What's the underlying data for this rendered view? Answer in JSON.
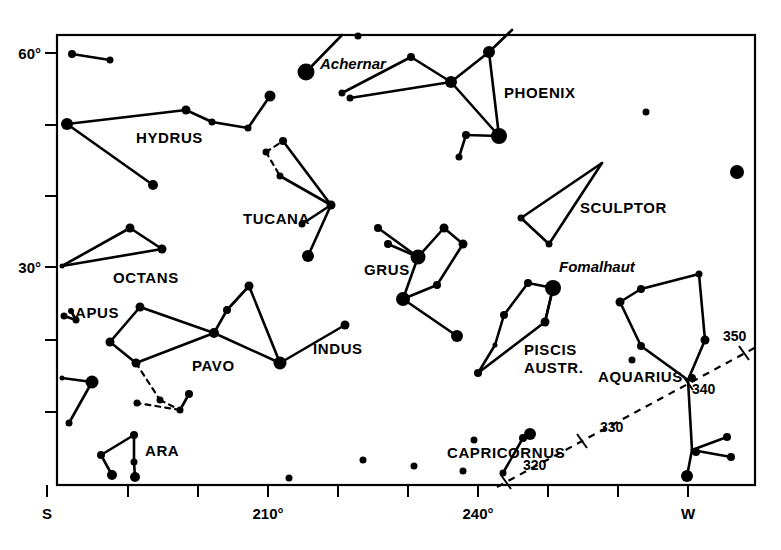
{
  "chart_data": {
    "type": "scatter",
    "title": "",
    "subtitle": "",
    "xlabel": "",
    "ylabel": "",
    "grid": false,
    "legend": null,
    "plot_frame": {
      "x0": 57,
      "y0": 35,
      "x1": 755,
      "y1": 485
    },
    "x_axis": {
      "range_label": [
        "S",
        "W"
      ],
      "ticks": [
        {
          "px": 47,
          "label": "S",
          "show_label": true
        },
        {
          "px": 128,
          "label": "",
          "show_label": false
        },
        {
          "px": 198,
          "label": "",
          "show_label": false
        },
        {
          "px": 268,
          "label": "210°",
          "show_label": true
        },
        {
          "px": 338,
          "label": "",
          "show_label": false
        },
        {
          "px": 408,
          "label": "",
          "show_label": false
        },
        {
          "px": 478,
          "label": "240°",
          "show_label": true
        },
        {
          "px": 548,
          "label": "",
          "show_label": false
        },
        {
          "px": 618,
          "label": "",
          "show_label": false
        },
        {
          "px": 688,
          "label": "W",
          "show_label": true
        }
      ]
    },
    "y_axis": {
      "ticks": [
        {
          "px": 53,
          "label": "60°",
          "show_label": true
        },
        {
          "px": 125,
          "label": "",
          "show_label": false
        },
        {
          "px": 196,
          "label": "",
          "show_label": false
        },
        {
          "px": 267,
          "label": "30°",
          "show_label": true
        },
        {
          "px": 340,
          "label": "",
          "show_label": false
        },
        {
          "px": 412,
          "label": "",
          "show_label": false
        }
      ]
    },
    "ecliptic": {
      "style": "dashed",
      "path": [
        [
          497,
          487
        ],
        [
          760,
          345
        ]
      ],
      "ticks": [
        {
          "x": 506,
          "y": 482,
          "label": "320",
          "lx": 523,
          "ly": 470
        },
        {
          "x": 582,
          "y": 441,
          "label": "330",
          "lx": 600,
          "ly": 432
        },
        {
          "x": 688,
          "y": 383,
          "label": "340",
          "lx": 692,
          "ly": 394
        },
        {
          "x": 744,
          "y": 353,
          "label": "350",
          "lx": 723,
          "ly": 341
        }
      ]
    },
    "constellation_labels": [
      {
        "name": "HYDRUS",
        "x": 136,
        "y": 143
      },
      {
        "name": "OCTANS",
        "x": 113,
        "y": 283
      },
      {
        "name": "APUS",
        "x": 75,
        "y": 318
      },
      {
        "name": "PAVO",
        "x": 192,
        "y": 371
      },
      {
        "name": "ARA",
        "x": 145,
        "y": 456
      },
      {
        "name": "TUCANA",
        "x": 243,
        "y": 224
      },
      {
        "name": "INDUS",
        "x": 313,
        "y": 354
      },
      {
        "name": "GRUS",
        "x": 364,
        "y": 275
      },
      {
        "name": "PHOENIX",
        "x": 504,
        "y": 98
      },
      {
        "name": "SCULPTOR",
        "x": 580,
        "y": 213
      },
      {
        "name": "PISCIS",
        "x": 524,
        "y": 355
      },
      {
        "name": "AUSTR.",
        "x": 524,
        "y": 373
      },
      {
        "name": "AQUARIUS",
        "x": 598,
        "y": 382
      },
      {
        "name": "CAPRICORNUS",
        "x": 447,
        "y": 458
      }
    ],
    "star_labels": [
      {
        "name": "Achernar",
        "x": 320,
        "y": 69
      },
      {
        "name": "Fomalhaut",
        "x": 559,
        "y": 272
      }
    ],
    "stars": [
      {
        "x": 72,
        "y": 54,
        "r": 4.0
      },
      {
        "x": 110,
        "y": 60,
        "r": 3.5
      },
      {
        "x": 67,
        "y": 124,
        "r": 6.0
      },
      {
        "x": 186,
        "y": 110,
        "r": 4.5
      },
      {
        "x": 212,
        "y": 122,
        "r": 3.5
      },
      {
        "x": 248,
        "y": 128,
        "r": 3.5
      },
      {
        "x": 270,
        "y": 96,
        "r": 5.5
      },
      {
        "x": 153,
        "y": 185,
        "r": 5.0
      },
      {
        "x": 130,
        "y": 228,
        "r": 4.5
      },
      {
        "x": 162,
        "y": 249,
        "r": 4.5
      },
      {
        "x": 62,
        "y": 266,
        "r": 2.5
      },
      {
        "x": 64,
        "y": 316,
        "r": 3.5
      },
      {
        "x": 76,
        "y": 320,
        "r": 3.5
      },
      {
        "x": 71,
        "y": 311,
        "r": 3.0
      },
      {
        "x": 92,
        "y": 382,
        "r": 6.5
      },
      {
        "x": 62,
        "y": 378,
        "r": 2.5
      },
      {
        "x": 69,
        "y": 423,
        "r": 3.5
      },
      {
        "x": 140,
        "y": 307,
        "r": 4.5
      },
      {
        "x": 110,
        "y": 342,
        "r": 4.5
      },
      {
        "x": 136,
        "y": 363,
        "r": 4.5
      },
      {
        "x": 214,
        "y": 333,
        "r": 5.0
      },
      {
        "x": 227,
        "y": 310,
        "r": 4.0
      },
      {
        "x": 249,
        "y": 286,
        "r": 4.5
      },
      {
        "x": 280,
        "y": 363,
        "r": 6.5
      },
      {
        "x": 160,
        "y": 400,
        "r": 3.5
      },
      {
        "x": 137,
        "y": 403,
        "r": 3.5
      },
      {
        "x": 180,
        "y": 410,
        "r": 3.5
      },
      {
        "x": 189,
        "y": 394,
        "r": 4.0
      },
      {
        "x": 134,
        "y": 435,
        "r": 4.0
      },
      {
        "x": 101,
        "y": 455,
        "r": 4.0
      },
      {
        "x": 112,
        "y": 475,
        "r": 5.0
      },
      {
        "x": 135,
        "y": 477,
        "r": 5.0
      },
      {
        "x": 134,
        "y": 462,
        "r": 3.5
      },
      {
        "x": 280,
        "y": 176,
        "r": 3.5
      },
      {
        "x": 266,
        "y": 152,
        "r": 3.5
      },
      {
        "x": 283,
        "y": 141,
        "r": 4.0
      },
      {
        "x": 331,
        "y": 205,
        "r": 4.5
      },
      {
        "x": 308,
        "y": 256,
        "r": 6.0
      },
      {
        "x": 302,
        "y": 224,
        "r": 3.5
      },
      {
        "x": 345,
        "y": 325,
        "r": 4.5
      },
      {
        "x": 306,
        "y": 72,
        "r": 8.5
      },
      {
        "x": 358,
        "y": 36,
        "r": 3.5
      },
      {
        "x": 342,
        "y": 93,
        "r": 3.5
      },
      {
        "x": 411,
        "y": 57,
        "r": 4.0
      },
      {
        "x": 350,
        "y": 98,
        "r": 3.5
      },
      {
        "x": 451,
        "y": 82,
        "r": 6.0
      },
      {
        "x": 489,
        "y": 52,
        "r": 6.0
      },
      {
        "x": 499,
        "y": 136,
        "r": 8.0
      },
      {
        "x": 466,
        "y": 135,
        "r": 4.0
      },
      {
        "x": 459,
        "y": 157,
        "r": 3.5
      },
      {
        "x": 378,
        "y": 228,
        "r": 4.0
      },
      {
        "x": 388,
        "y": 244,
        "r": 4.0
      },
      {
        "x": 418,
        "y": 257,
        "r": 7.5
      },
      {
        "x": 444,
        "y": 228,
        "r": 4.5
      },
      {
        "x": 463,
        "y": 244,
        "r": 4.5
      },
      {
        "x": 437,
        "y": 285,
        "r": 4.0
      },
      {
        "x": 403,
        "y": 299,
        "r": 7.0
      },
      {
        "x": 457,
        "y": 336,
        "r": 6.0
      },
      {
        "x": 528,
        "y": 283,
        "r": 4.0
      },
      {
        "x": 553,
        "y": 288,
        "r": 8.0
      },
      {
        "x": 504,
        "y": 315,
        "r": 4.0
      },
      {
        "x": 545,
        "y": 322,
        "r": 4.5
      },
      {
        "x": 495,
        "y": 345,
        "r": 2.5
      },
      {
        "x": 478,
        "y": 373,
        "r": 4.0
      },
      {
        "x": 521,
        "y": 218,
        "r": 3.5
      },
      {
        "x": 549,
        "y": 244,
        "r": 3.5
      },
      {
        "x": 646,
        "y": 112,
        "r": 3.5
      },
      {
        "x": 737,
        "y": 172,
        "r": 7.0
      },
      {
        "x": 641,
        "y": 289,
        "r": 4.0
      },
      {
        "x": 620,
        "y": 302,
        "r": 4.5
      },
      {
        "x": 699,
        "y": 274,
        "r": 3.5
      },
      {
        "x": 641,
        "y": 346,
        "r": 4.0
      },
      {
        "x": 632,
        "y": 360,
        "r": 3.5
      },
      {
        "x": 705,
        "y": 340,
        "r": 4.5
      },
      {
        "x": 692,
        "y": 378,
        "r": 4.0
      },
      {
        "x": 696,
        "y": 452,
        "r": 4.0
      },
      {
        "x": 727,
        "y": 437,
        "r": 4.0
      },
      {
        "x": 731,
        "y": 457,
        "r": 4.0
      },
      {
        "x": 687,
        "y": 476,
        "r": 6.0
      },
      {
        "x": 523,
        "y": 438,
        "r": 4.0
      },
      {
        "x": 530,
        "y": 434,
        "r": 6.0
      },
      {
        "x": 474,
        "y": 440,
        "r": 3.5
      },
      {
        "x": 463,
        "y": 471,
        "r": 3.5
      },
      {
        "x": 503,
        "y": 473,
        "r": 3.5
      },
      {
        "x": 414,
        "y": 466,
        "r": 3.5
      },
      {
        "x": 363,
        "y": 460,
        "r": 3.5
      },
      {
        "x": 289,
        "y": 478,
        "r": 3.5
      }
    ],
    "lines_solid": [
      [
        [
          72,
          54
        ],
        [
          110,
          60
        ]
      ],
      [
        [
          67,
          124
        ],
        [
          186,
          110
        ]
      ],
      [
        [
          186,
          110
        ],
        [
          212,
          122
        ]
      ],
      [
        [
          212,
          122
        ],
        [
          248,
          128
        ]
      ],
      [
        [
          248,
          128
        ],
        [
          270,
          96
        ]
      ],
      [
        [
          67,
          124
        ],
        [
          153,
          185
        ]
      ],
      [
        [
          62,
          266
        ],
        [
          130,
          228
        ]
      ],
      [
        [
          130,
          228
        ],
        [
          162,
          249
        ]
      ],
      [
        [
          162,
          249
        ],
        [
          62,
          266
        ]
      ],
      [
        [
          64,
          316
        ],
        [
          76,
          320
        ]
      ],
      [
        [
          71,
          311
        ],
        [
          76,
          320
        ]
      ],
      [
        [
          62,
          378
        ],
        [
          92,
          382
        ]
      ],
      [
        [
          92,
          382
        ],
        [
          69,
          423
        ]
      ],
      [
        [
          140,
          307
        ],
        [
          110,
          342
        ]
      ],
      [
        [
          110,
          342
        ],
        [
          136,
          363
        ]
      ],
      [
        [
          136,
          363
        ],
        [
          214,
          333
        ]
      ],
      [
        [
          214,
          333
        ],
        [
          140,
          307
        ]
      ],
      [
        [
          214,
          333
        ],
        [
          227,
          310
        ]
      ],
      [
        [
          227,
          310
        ],
        [
          249,
          286
        ]
      ],
      [
        [
          249,
          286
        ],
        [
          280,
          363
        ]
      ],
      [
        [
          214,
          333
        ],
        [
          280,
          363
        ]
      ],
      [
        [
          189,
          394
        ],
        [
          180,
          410
        ]
      ],
      [
        [
          134,
          435
        ],
        [
          101,
          455
        ]
      ],
      [
        [
          101,
          455
        ],
        [
          112,
          475
        ]
      ],
      [
        [
          134,
          435
        ],
        [
          134,
          462
        ]
      ],
      [
        [
          134,
          462
        ],
        [
          135,
          477
        ]
      ],
      [
        [
          283,
          141
        ],
        [
          331,
          205
        ]
      ],
      [
        [
          280,
          176
        ],
        [
          331,
          205
        ]
      ],
      [
        [
          331,
          205
        ],
        [
          308,
          256
        ]
      ],
      [
        [
          302,
          224
        ],
        [
          331,
          205
        ]
      ],
      [
        [
          345,
          325
        ],
        [
          280,
          363
        ]
      ],
      [
        [
          306,
          72
        ],
        [
          342,
          35
        ]
      ],
      [
        [
          342,
          93
        ],
        [
          411,
          57
        ]
      ],
      [
        [
          411,
          57
        ],
        [
          451,
          82
        ]
      ],
      [
        [
          350,
          98
        ],
        [
          451,
          82
        ]
      ],
      [
        [
          451,
          82
        ],
        [
          489,
          52
        ]
      ],
      [
        [
          489,
          52
        ],
        [
          512,
          30
        ]
      ],
      [
        [
          451,
          82
        ],
        [
          499,
          136
        ]
      ],
      [
        [
          489,
          52
        ],
        [
          499,
          136
        ]
      ],
      [
        [
          466,
          135
        ],
        [
          499,
          136
        ]
      ],
      [
        [
          459,
          157
        ],
        [
          466,
          135
        ]
      ],
      [
        [
          378,
          228
        ],
        [
          418,
          257
        ]
      ],
      [
        [
          388,
          244
        ],
        [
          418,
          257
        ]
      ],
      [
        [
          418,
          257
        ],
        [
          444,
          228
        ]
      ],
      [
        [
          444,
          228
        ],
        [
          463,
          244
        ]
      ],
      [
        [
          463,
          244
        ],
        [
          437,
          285
        ]
      ],
      [
        [
          437,
          285
        ],
        [
          403,
          299
        ]
      ],
      [
        [
          418,
          257
        ],
        [
          403,
          299
        ]
      ],
      [
        [
          403,
          299
        ],
        [
          457,
          336
        ]
      ],
      [
        [
          521,
          218
        ],
        [
          602,
          163
        ]
      ],
      [
        [
          549,
          244
        ],
        [
          602,
          163
        ]
      ],
      [
        [
          521,
          218
        ],
        [
          549,
          244
        ]
      ],
      [
        [
          528,
          283
        ],
        [
          553,
          288
        ]
      ],
      [
        [
          528,
          283
        ],
        [
          504,
          315
        ]
      ],
      [
        [
          504,
          315
        ],
        [
          495,
          345
        ]
      ],
      [
        [
          495,
          345
        ],
        [
          478,
          373
        ]
      ],
      [
        [
          478,
          373
        ],
        [
          545,
          322
        ]
      ],
      [
        [
          553,
          288
        ],
        [
          545,
          322
        ]
      ],
      [
        [
          641,
          289
        ],
        [
          620,
          302
        ]
      ],
      [
        [
          641,
          289
        ],
        [
          699,
          274
        ]
      ],
      [
        [
          699,
          274
        ],
        [
          705,
          340
        ]
      ],
      [
        [
          620,
          302
        ],
        [
          641,
          346
        ]
      ],
      [
        [
          641,
          346
        ],
        [
          688,
          380
        ]
      ],
      [
        [
          705,
          340
        ],
        [
          688,
          380
        ]
      ],
      [
        [
          688,
          380
        ],
        [
          692,
          450
        ]
      ],
      [
        [
          692,
          450
        ],
        [
          687,
          476
        ]
      ],
      [
        [
          692,
          450
        ],
        [
          727,
          437
        ]
      ],
      [
        [
          692,
          450
        ],
        [
          731,
          457
        ]
      ],
      [
        [
          523,
          438
        ],
        [
          503,
          473
        ]
      ],
      [
        [
          545,
          322
        ],
        [
          553,
          288
        ]
      ]
    ],
    "lines_dashed": [
      [
        [
          266,
          152
        ],
        [
          283,
          141
        ]
      ],
      [
        [
          266,
          152
        ],
        [
          280,
          176
        ]
      ],
      [
        [
          136,
          363
        ],
        [
          160,
          400
        ]
      ],
      [
        [
          160,
          400
        ],
        [
          180,
          410
        ]
      ],
      [
        [
          180,
          410
        ],
        [
          137,
          403
        ]
      ],
      [
        [
          249,
          286
        ],
        [
          227,
          310
        ]
      ]
    ]
  },
  "colors": {
    "ink": "#000000",
    "background": "#ffffff"
  }
}
